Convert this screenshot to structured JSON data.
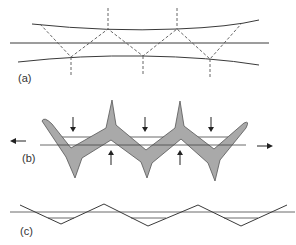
{
  "figure": {
    "panels": [
      {
        "id": "a",
        "label": "(a)",
        "description": "Fibre between two curved boundaries with dashed zigzag reflection path and vertical dashed lines"
      },
      {
        "id": "b",
        "label": "(b)",
        "description": "Grey zigzag chevron-shaped body with compressive arrows above and below, tension arrows left and right"
      },
      {
        "id": "c",
        "label": "(c)",
        "description": "Zigzag line crossing horizontal reference lines"
      }
    ],
    "colors": {
      "background": "#ffffff",
      "line": "#3a3a3a",
      "shape_fill": "#a9a9a9",
      "arrow": "#222222"
    }
  }
}
